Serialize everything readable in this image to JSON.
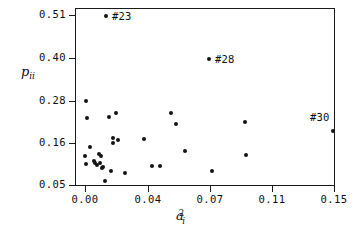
{
  "chart_data": {
    "type": "scatter",
    "title": "",
    "xlabel": "a_i^2",
    "ylabel": "p_ii",
    "xlabel_parts": {
      "base": "a",
      "sub": "i",
      "sup": "2"
    },
    "ylabel_parts": {
      "base": "p",
      "sub": "ii"
    },
    "grid": false,
    "legend": null,
    "xticks": [
      "0.00",
      "0.04",
      "0.07",
      "0.11",
      "0.15"
    ],
    "xtick_values": [
      0.0,
      0.04,
      0.07,
      0.11,
      0.15
    ],
    "yticks": [
      "0.05",
      "0.16",
      "0.28",
      "0.40",
      "0.51"
    ],
    "ytick_values": [
      0.05,
      0.16,
      0.28,
      0.4,
      0.51
    ],
    "xlim": [
      -0.004,
      0.157
    ],
    "ylim": [
      0.039,
      0.524
    ],
    "marker": "filled-circle",
    "marker_color": "#141414",
    "points": [
      {
        "x": 0.0,
        "y": 0.296,
        "px": 85,
        "py": 100
      },
      {
        "x": 0.0005,
        "y": 0.231,
        "px": 86,
        "py": 117
      },
      {
        "x": 0.0,
        "y": 0.116,
        "px": 84,
        "py": 155
      },
      {
        "x": 0.0003,
        "y": 0.093,
        "px": 85,
        "py": 163
      },
      {
        "x": 0.002,
        "y": 0.144,
        "px": 89,
        "py": 146
      },
      {
        "x": 0.0045,
        "y": 0.102,
        "px": 93,
        "py": 160
      },
      {
        "x": 0.0052,
        "y": 0.096,
        "px": 94,
        "py": 162
      },
      {
        "x": 0.006,
        "y": 0.091,
        "px": 96,
        "py": 164
      },
      {
        "x": 0.0072,
        "y": 0.122,
        "px": 98,
        "py": 153
      },
      {
        "x": 0.0078,
        "y": 0.096,
        "px": 99,
        "py": 162
      },
      {
        "x": 0.0085,
        "y": 0.117,
        "px": 100,
        "py": 155
      },
      {
        "x": 0.009,
        "y": 0.082,
        "px": 101,
        "py": 167
      },
      {
        "x": 0.0098,
        "y": 0.086,
        "px": 102,
        "py": 166
      },
      {
        "x": 0.0105,
        "y": 0.051,
        "px": 104,
        "py": 180
      },
      {
        "x": 0.011,
        "y": 0.511,
        "px": 105,
        "py": 15
      },
      {
        "x": 0.0128,
        "y": 0.232,
        "px": 108,
        "py": 116
      },
      {
        "x": 0.014,
        "y": 0.076,
        "px": 110,
        "py": 170
      },
      {
        "x": 0.015,
        "y": 0.162,
        "px": 112,
        "py": 137
      },
      {
        "x": 0.0152,
        "y": 0.15,
        "px": 112,
        "py": 142
      },
      {
        "x": 0.0172,
        "y": 0.245,
        "px": 115,
        "py": 112
      },
      {
        "x": 0.018,
        "y": 0.157,
        "px": 117,
        "py": 139
      },
      {
        "x": 0.0225,
        "y": 0.072,
        "px": 124,
        "py": 172
      },
      {
        "x": 0.0345,
        "y": 0.16,
        "px": 143,
        "py": 138
      },
      {
        "x": 0.0395,
        "y": 0.088,
        "px": 151,
        "py": 165
      },
      {
        "x": 0.0442,
        "y": 0.088,
        "px": 159,
        "py": 165
      },
      {
        "x": 0.051,
        "y": 0.245,
        "px": 170,
        "py": 112
      },
      {
        "x": 0.0545,
        "y": 0.212,
        "px": 175,
        "py": 123
      },
      {
        "x": 0.06,
        "y": 0.131,
        "px": 184,
        "py": 150
      },
      {
        "x": 0.0705,
        "y": 0.399,
        "px": 208,
        "py": 58
      },
      {
        "x": 0.072,
        "y": 0.077,
        "px": 211,
        "py": 170
      },
      {
        "x": 0.0905,
        "y": 0.216,
        "px": 244,
        "py": 121
      },
      {
        "x": 0.091,
        "y": 0.12,
        "px": 245,
        "py": 154
      },
      {
        "x": 0.149,
        "y": 0.192,
        "px": 332,
        "py": 130
      }
    ],
    "annotations": [
      {
        "label": "#23",
        "point_px": 105,
        "point_py": 15,
        "text_px": 112,
        "text_py": 10
      },
      {
        "label": "#28",
        "point_px": 208,
        "point_py": 58,
        "text_px": 215,
        "text_py": 53
      },
      {
        "label": "#30",
        "point_px": 332,
        "point_py": 130,
        "text_px": 310,
        "text_py": 111
      }
    ]
  },
  "axes": {
    "frame_color": "#1a1a1a",
    "background": "#ffffff",
    "tick_color": "#1a1a1a",
    "tick_label_color": "#0d0d0d"
  }
}
